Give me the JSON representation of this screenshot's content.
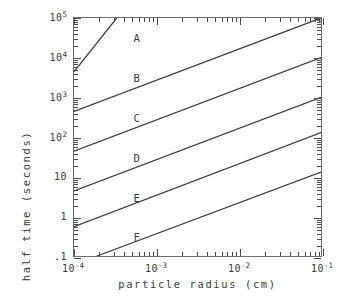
{
  "chart_data": {
    "type": "line",
    "title": "",
    "xlabel": "particle radius (cm)",
    "ylabel": "half time (seconds)",
    "xscale": "log",
    "yscale": "log",
    "xlim": [
      0.0001,
      0.1
    ],
    "ylim": [
      0.1,
      100000
    ],
    "grid": false,
    "legend": "inline-labels",
    "x_ticklabels": [
      "10⁻⁴",
      "10⁻³",
      "10⁻²",
      "10⁻¹"
    ],
    "x_tickvalues": [
      0.0001,
      0.001,
      0.01,
      0.1
    ],
    "y_ticklabels": [
      "10⁵",
      "10⁴",
      "10³",
      "10²",
      "10",
      "1",
      ".1"
    ],
    "y_tickvalues": [
      100000,
      10000,
      1000,
      100,
      10,
      1,
      0.1
    ],
    "series": [
      {
        "name": "A",
        "label": "A",
        "x": [
          0.0001,
          0.00033
        ],
        "y": [
          4400,
          100000
        ],
        "label_at": {
          "x": 0.00057,
          "y": 32000
        }
      },
      {
        "name": "B",
        "label": "B",
        "x": [
          0.0001,
          0.1
        ],
        "y": [
          440,
          100000
        ],
        "label_at": {
          "x": 0.00057,
          "y": 3200
        }
      },
      {
        "name": "C",
        "label": "C",
        "x": [
          0.0001,
          0.1
        ],
        "y": [
          44,
          10000
        ],
        "label_at": {
          "x": 0.00057,
          "y": 320
        }
      },
      {
        "name": "D",
        "label": "D",
        "x": [
          0.0001,
          0.1
        ],
        "y": [
          4.4,
          1000
        ],
        "label_at": {
          "x": 0.00057,
          "y": 32
        }
      },
      {
        "name": "E",
        "label": "E",
        "x": [
          0.0001,
          0.1
        ],
        "y": [
          0.55,
          130
        ],
        "label_at": {
          "x": 0.00057,
          "y": 3.2
        }
      },
      {
        "name": "F",
        "label": "F",
        "x": [
          0.00019,
          0.1
        ],
        "y": [
          0.1,
          13
        ],
        "label_at": {
          "x": 0.00057,
          "y": 0.34
        }
      }
    ]
  },
  "axes": {
    "x_title": "particle radius (cm)",
    "y_title": "half time (seconds)"
  },
  "y_ticks": [
    {
      "label_base": "10",
      "label_exp": "5"
    },
    {
      "label_base": "10",
      "label_exp": "4"
    },
    {
      "label_base": "10",
      "label_exp": "3"
    },
    {
      "label_base": "10",
      "label_exp": "2"
    },
    {
      "label_base": "10",
      "label_exp": ""
    },
    {
      "label_base": "1",
      "label_exp": ""
    },
    {
      "label_base": ".1",
      "label_exp": ""
    }
  ],
  "x_ticks": [
    {
      "label_base": "10",
      "label_exp": "-4"
    },
    {
      "label_base": "10",
      "label_exp": "-3"
    },
    {
      "label_base": "10",
      "label_exp": "-2"
    },
    {
      "label_base": "10",
      "label_exp": "-1"
    }
  ],
  "curve_labels": [
    "A",
    "B",
    "C",
    "D",
    "E",
    "F"
  ],
  "colors": {
    "line": "#3c3c3c",
    "frame": "#6d6d6d",
    "text": "#3a3a3a",
    "background": "#ffffff"
  }
}
